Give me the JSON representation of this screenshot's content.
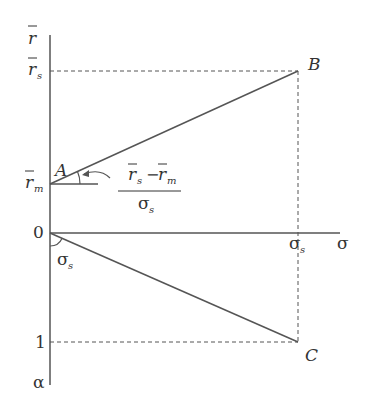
{
  "diagram": {
    "axes": {
      "vertical_top_label": "r",
      "vertical_bottom_label": "α",
      "horizontal_label": "σ",
      "origin_label": "0"
    },
    "ticks": {
      "rs_label": "r",
      "rs_sub": "s",
      "rm_label": "r",
      "rm_sub": "m",
      "one_label": "1",
      "sigma_s_label": "σ",
      "sigma_s_sub": "s"
    },
    "points": {
      "A": "A",
      "B": "B",
      "C": "C"
    },
    "slope_annotation": {
      "numerator_r1": "r",
      "numerator_sub1": "s",
      "minus": "−",
      "numerator_r2": "r",
      "numerator_sub2": "m",
      "denominator": "σ",
      "denominator_sub": "s"
    },
    "angle_annotation": {
      "label": "σ",
      "sub": "s"
    },
    "colors": {
      "line": "#555555",
      "text": "#333333"
    }
  }
}
